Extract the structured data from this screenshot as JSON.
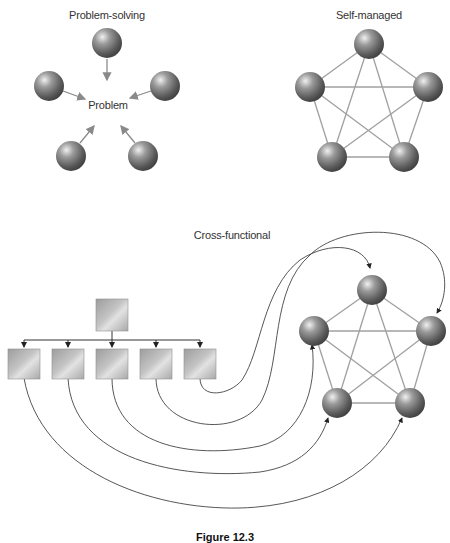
{
  "panels": {
    "problem_solving": {
      "title": "Problem-solving",
      "center_label": "Problem",
      "members": 5
    },
    "self_managed": {
      "title": "Self-managed",
      "members": 5
    },
    "cross_functional": {
      "title": "Cross-functional",
      "hierarchy_top": 1,
      "hierarchy_bottom": 5,
      "team_members": 5
    }
  },
  "caption": "Figure 12.3",
  "colors": {
    "sphere_dark": "#555555",
    "sphere_light": "#e8e8e8",
    "link_line": "#9a9a9a",
    "arrow_line": "#555555",
    "box_fill": "#b5b5b5"
  }
}
